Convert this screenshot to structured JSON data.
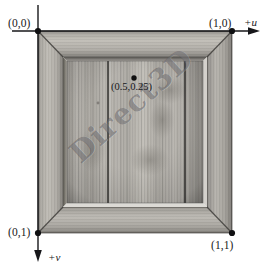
{
  "figure": {
    "background_color": "#ffffff",
    "width": 270,
    "height": 273
  },
  "axes": {
    "u_axis_label": "+u",
    "v_axis_label": "+v",
    "u_direction": "right",
    "v_direction": "down",
    "line_color": "#1a1a1a",
    "origin_px": [
      38,
      31
    ]
  },
  "corner_labels": {
    "top_left": "(0,0)",
    "top_right": "(1,0)",
    "bottom_left": "(0,1)",
    "bottom_right": "(1,1)"
  },
  "point_annotation": {
    "label": "(0.5,0.25)",
    "u": 0.5,
    "v": 0.25,
    "marker_color": "#101010"
  },
  "texture": {
    "watermark_text": "Direct3D",
    "watermark_color": "#3c3a3e",
    "material": "wood-plank-picture-frame",
    "frame_color": "#a8a6a2",
    "panel_color": "#b5b2ad",
    "plank_seam_count": 2
  }
}
